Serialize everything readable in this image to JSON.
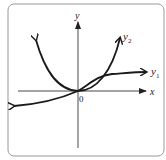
{
  "diagram": {
    "axes": {
      "x_label": "x",
      "y_label": "y",
      "origin_label": "0"
    },
    "curves": [
      {
        "name": "y1",
        "label_main": "y",
        "label_sub": "1",
        "description": "increasing curve through origin, flattening out"
      },
      {
        "name": "y2",
        "label_main": "y",
        "label_sub": "2",
        "description": "parabola-like curve with vertex at origin"
      }
    ],
    "colors": {
      "frame": "#999999",
      "curve": "#1a1a1a",
      "axis": "#333333"
    }
  }
}
